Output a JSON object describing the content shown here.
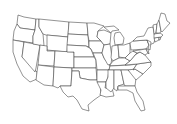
{
  "map": {
    "type": "outline",
    "region": "contiguous-united-states",
    "fill_color": "#ffffff",
    "stroke_color": "#3a3a3a",
    "background": "#ffffff",
    "labels": []
  }
}
